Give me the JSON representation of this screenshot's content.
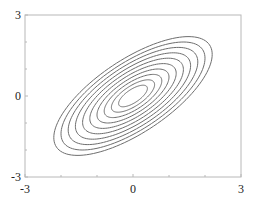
{
  "chart_data": {
    "type": "contour",
    "title": "",
    "xlabel": "",
    "ylabel": "",
    "xlim": [
      -3,
      3
    ],
    "ylim": [
      -3,
      3
    ],
    "x_ticks": [
      -3,
      0,
      3
    ],
    "y_ticks": [
      -3,
      0,
      3
    ],
    "x_tick_labels": [
      "-3",
      "0",
      "3"
    ],
    "y_tick_labels": [
      "-3",
      "0",
      "3"
    ],
    "minor_ticks_per_interval": 3,
    "grid": false,
    "legend": null,
    "distribution": {
      "mean": [
        0,
        0
      ],
      "sigma_x": 1,
      "sigma_y": 1,
      "correlation": 0.7
    },
    "contour_levels_mahalanobis_radius": [
      0.4,
      0.6,
      0.8,
      1.0,
      1.2,
      1.4,
      1.6,
      1.8,
      2.0,
      2.2
    ],
    "line_color": "#6e6e6e",
    "frame_color": "#b8b8b8"
  }
}
